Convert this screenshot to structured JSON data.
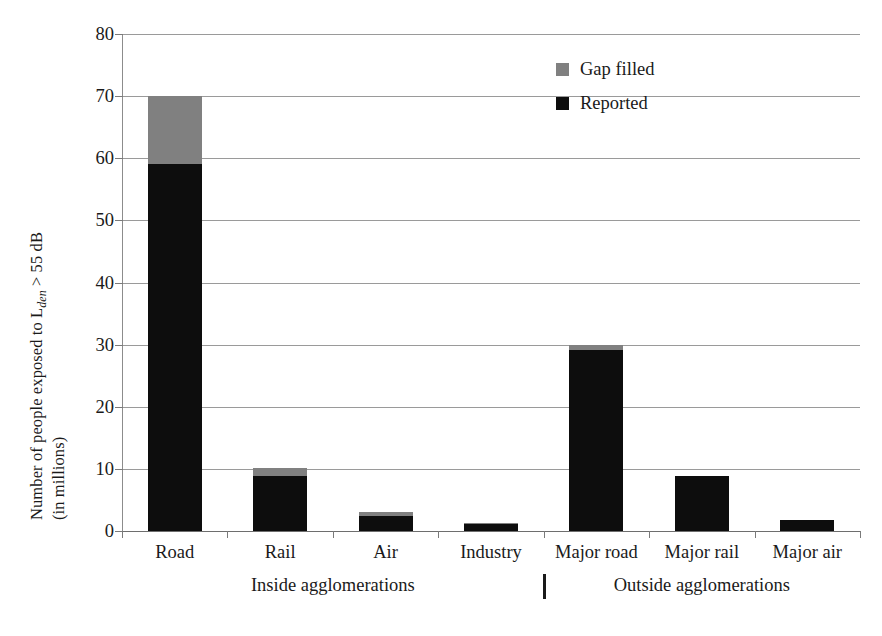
{
  "chart_data": {
    "type": "bar",
    "subtype": "stacked-vertical",
    "title": "",
    "xlabel": "",
    "ylabel": "Number of people exposed to Lden > 55 dB (in millions)",
    "ylabel_line1": "Number of people exposed to L",
    "ylabel_line1_sub": "den",
    "ylabel_line1_tail": " > 55 dB",
    "ylabel_line2": "(in millions)",
    "categories": [
      "Road",
      "Rail",
      "Air",
      "Industry",
      "Major road",
      "Major rail",
      "Major air"
    ],
    "series": [
      {
        "name": "Reported",
        "color": "#0d0d0d",
        "values": [
          59.0,
          8.8,
          2.4,
          1.1,
          29.2,
          8.9,
          1.7
        ]
      },
      {
        "name": "Gap filled",
        "color": "#808080",
        "values": [
          11.0,
          1.3,
          0.7,
          0.2,
          0.7,
          0.0,
          0.0
        ]
      }
    ],
    "totals": [
      70.0,
      10.1,
      3.1,
      1.3,
      29.9,
      8.9,
      1.7
    ],
    "ylim": [
      0,
      80
    ],
    "yticks": [
      0,
      10,
      20,
      30,
      40,
      50,
      60,
      70,
      80
    ],
    "ytick_labels": [
      "0",
      "10",
      "20",
      "30",
      "40",
      "50",
      "60",
      "70",
      "80"
    ],
    "grid": "horizontal",
    "legend_position": "top-right",
    "groups": [
      {
        "label": "Inside agglomerations",
        "categories": [
          "Road",
          "Rail",
          "Air",
          "Industry"
        ]
      },
      {
        "label": "Outside agglomerations",
        "categories": [
          "Major road",
          "Major rail",
          "Major air"
        ]
      }
    ],
    "group_separator": true
  },
  "legend": {
    "items": [
      {
        "label": "Gap filled",
        "color": "#808080"
      },
      {
        "label": "Reported",
        "color": "#0d0d0d"
      }
    ]
  },
  "colors": {
    "reported": "#0d0d0d",
    "gap_filled": "#808080",
    "gridline": "#9a9a9a",
    "axis": "#7a7a7a",
    "text": "#1a1a1a",
    "background": "#ffffff"
  }
}
